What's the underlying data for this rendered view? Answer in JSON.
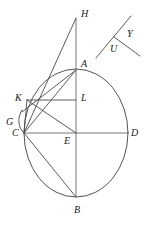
{
  "figure": {
    "stroke_color": "#4a4a4a",
    "label_color": "#1a1a1a",
    "background_color": "#ffffff",
    "width": 146,
    "height": 229,
    "labels": [
      {
        "id": "H",
        "text": "H",
        "x": 81,
        "y": 9
      },
      {
        "id": "Y",
        "text": "Y",
        "x": 127,
        "y": 29
      },
      {
        "id": "U",
        "text": "U",
        "x": 110,
        "y": 44
      },
      {
        "id": "A",
        "text": "A",
        "x": 81,
        "y": 59
      },
      {
        "id": "K",
        "text": "K",
        "x": 15,
        "y": 93
      },
      {
        "id": "L",
        "text": "L",
        "x": 81,
        "y": 93
      },
      {
        "id": "G",
        "text": "G",
        "x": 6,
        "y": 117
      },
      {
        "id": "C",
        "text": "C",
        "x": 12,
        "y": 128
      },
      {
        "id": "E",
        "text": "E",
        "x": 64,
        "y": 136
      },
      {
        "id": "D",
        "text": "D",
        "x": 131,
        "y": 128
      },
      {
        "id": "B",
        "text": "B",
        "x": 74,
        "y": 205
      }
    ],
    "points": {
      "H": {
        "x": 76,
        "y": 18
      },
      "A": {
        "x": 76,
        "y": 70
      },
      "K": {
        "x": 27,
        "y": 100
      },
      "L": {
        "x": 76,
        "y": 100
      },
      "G": {
        "x": 20,
        "y": 125
      },
      "C": {
        "x": 24,
        "y": 133
      },
      "E": {
        "x": 76,
        "y": 133
      },
      "D": {
        "x": 128,
        "y": 133
      },
      "B": {
        "x": 76,
        "y": 197
      },
      "Y_top": {
        "x": 131,
        "y": 16
      },
      "Y_vertex": {
        "x": 114,
        "y": 37
      },
      "Y_bottom": {
        "x": 96,
        "y": 58
      },
      "U_end": {
        "x": 140,
        "y": 56
      }
    },
    "ellipse": {
      "cx": 76,
      "cy": 133,
      "rx": 52,
      "ry": 64
    },
    "segments": [
      {
        "name": "segment-H-B",
        "from": "H",
        "to": "B"
      },
      {
        "name": "segment-H-C",
        "from": "H",
        "to": "C"
      },
      {
        "name": "segment-C-D",
        "from": "C",
        "to": "D"
      },
      {
        "name": "segment-C-A",
        "from": "C",
        "to": "A"
      },
      {
        "name": "segment-C-B",
        "from": "C",
        "to": "B"
      },
      {
        "name": "segment-K-L",
        "from": "K",
        "to": "L"
      },
      {
        "name": "segment-K-E",
        "from": "K",
        "to": "E"
      },
      {
        "name": "segment-C-K",
        "from": "C",
        "to": "K"
      },
      {
        "name": "segment-A-K",
        "from": "A",
        "to": "K"
      },
      {
        "name": "segment-Y-line",
        "from": "Y_bottom",
        "to": "Y_top"
      },
      {
        "name": "segment-U-line",
        "from": "Y_vertex",
        "to": "U_end"
      }
    ]
  }
}
